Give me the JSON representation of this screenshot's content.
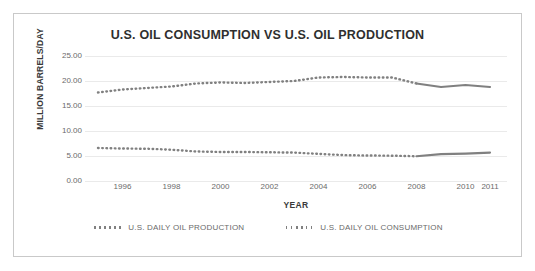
{
  "chart_data": {
    "type": "line",
    "title": "U.S. OIL CONSUMPTION VS U.S. OIL PRODUCTION",
    "xlabel": "YEAR",
    "ylabel": "MILLION BARRELS/DAY",
    "xlim": [
      1995,
      2011
    ],
    "ylim": [
      0,
      25
    ],
    "ytick_labels": [
      "25.00",
      "20.00",
      "15.00",
      "10.00",
      "5.00",
      "0.00"
    ],
    "ytick_values": [
      25,
      20,
      15,
      10,
      5,
      0
    ],
    "xtick_labels": [
      "1996",
      "1998",
      "2000",
      "2002",
      "2004",
      "2006",
      "2008",
      "2010",
      "2011"
    ],
    "xtick_values": [
      1996,
      1998,
      2000,
      2002,
      2004,
      2006,
      2008,
      2010,
      2011
    ],
    "grid": true,
    "legend_position": "bottom",
    "series_color": "#808080",
    "x": [
      1995,
      1996,
      1997,
      1998,
      1999,
      2000,
      2001,
      2002,
      2003,
      2004,
      2005,
      2006,
      2007,
      2008,
      2009,
      2010,
      2011
    ],
    "series": [
      {
        "name": "U.S. DAILY OIL CONSUMPTION",
        "values": [
          17.7,
          18.3,
          18.6,
          18.9,
          19.5,
          19.7,
          19.6,
          19.8,
          20.0,
          20.7,
          20.8,
          20.7,
          20.7,
          19.5,
          18.8,
          19.2,
          18.8
        ],
        "color": "#808080"
      },
      {
        "name": "U.S. DAILY OIL PRODUCTION",
        "values": [
          6.6,
          6.5,
          6.45,
          6.25,
          5.9,
          5.8,
          5.8,
          5.75,
          5.68,
          5.42,
          5.18,
          5.1,
          5.06,
          4.95,
          5.36,
          5.47,
          5.67
        ],
        "color": "#808080"
      }
    ]
  },
  "legend": {
    "items": [
      {
        "label": "U.S. DAILY OIL PRODUCTION"
      },
      {
        "label": "U.S. DAILY OIL CONSUMPTION"
      }
    ]
  }
}
